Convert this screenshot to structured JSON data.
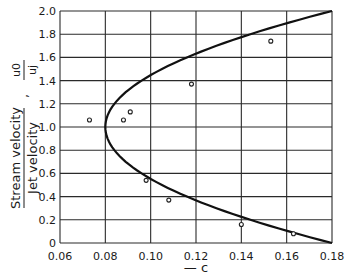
{
  "chart_data": {
    "type": "scatter",
    "title": "",
    "xlabel": "— c",
    "ylabel": "Stream velocity / Jet velocity , u0/uj",
    "ylabel_parts": {
      "numerator": "Stream velocity",
      "denominator": "Jet velocity",
      "sep": ",",
      "sym_num": "u0",
      "sym_den": "uj"
    },
    "xlim": [
      0.06,
      0.18
    ],
    "ylim": [
      0,
      2.0
    ],
    "x_ticks": [
      "0.06",
      "0.08",
      "0.10",
      "0.12",
      "0.14",
      "0.16",
      "0.18"
    ],
    "y_ticks": [
      "0",
      "0.2",
      "0.4",
      "0.6",
      "0.8",
      "1.0",
      "1.2",
      "1.4",
      "1.6",
      "1.8",
      "2.0"
    ],
    "grid": true,
    "legend": null,
    "series": [
      {
        "name": "theory curve",
        "kind": "line",
        "equation": "c = 0.08 + 0.1*(u0/uj - 1)^2",
        "x": [
          0.18,
          0.144,
          0.116,
          0.096,
          0.084,
          0.08,
          0.084,
          0.096,
          0.116,
          0.144,
          0.18
        ],
        "y": [
          0.0,
          0.2,
          0.4,
          0.6,
          0.8,
          1.0,
          1.2,
          1.4,
          1.6,
          1.8,
          2.0
        ]
      },
      {
        "name": "experimental points",
        "kind": "scatter",
        "x": [
          0.073,
          0.088,
          0.091,
          0.118,
          0.153,
          0.098,
          0.108,
          0.14,
          0.163
        ],
        "y": [
          1.06,
          1.06,
          1.13,
          1.37,
          1.74,
          0.54,
          0.37,
          0.16,
          0.08
        ]
      }
    ]
  }
}
